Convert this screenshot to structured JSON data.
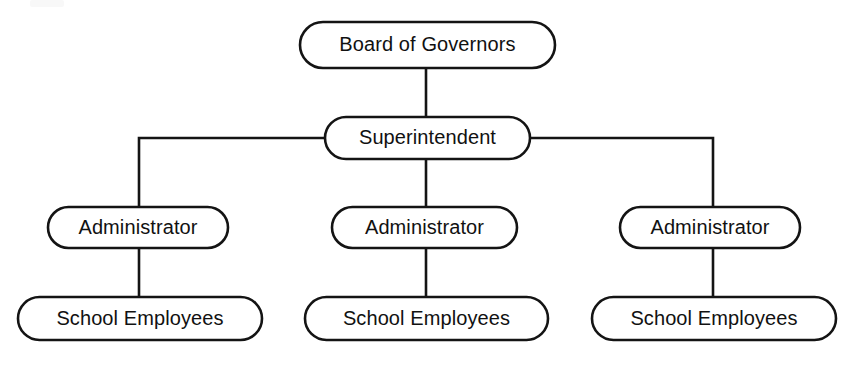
{
  "diagram": {
    "type": "organizational-chart",
    "background_color": "#ffffff",
    "stroke_color": "#141414",
    "text_color": "#111111",
    "node_shape": "rounded-pill",
    "levels": 4,
    "nodes": [
      {
        "id": "board",
        "label": "Board of Governors",
        "level": 1,
        "x": 300,
        "y": 22,
        "w": 255,
        "h": 46
      },
      {
        "id": "superintendent",
        "label": "Superintendent",
        "level": 2,
        "x": 325,
        "y": 117,
        "w": 205,
        "h": 42
      },
      {
        "id": "administrator-1",
        "label": "Administrator",
        "level": 3,
        "x": 48,
        "y": 207,
        "w": 180,
        "h": 41
      },
      {
        "id": "administrator-2",
        "label": "Administrator",
        "level": 3,
        "x": 332,
        "y": 207,
        "w": 185,
        "h": 41
      },
      {
        "id": "administrator-3",
        "label": "Administrator",
        "level": 3,
        "x": 620,
        "y": 207,
        "w": 180,
        "h": 41
      },
      {
        "id": "school-employees-1",
        "label": "School Employees",
        "level": 4,
        "x": 18,
        "y": 297,
        "w": 244,
        "h": 43
      },
      {
        "id": "school-employees-2",
        "label": "School Employees",
        "level": 4,
        "x": 305,
        "y": 297,
        "w": 243,
        "h": 43
      },
      {
        "id": "school-employees-3",
        "label": "School Employees",
        "level": 4,
        "x": 592,
        "y": 297,
        "w": 244,
        "h": 43
      }
    ],
    "connectors": [
      {
        "id": "board-to-superintendent",
        "from": "board",
        "to": "superintendent",
        "path": "M 426 68 L 426 117"
      },
      {
        "id": "superintendent-left-bus",
        "from": "superintendent",
        "to": "administrator-1",
        "path": "M 325 138 L 139 138 L 139 207"
      },
      {
        "id": "superintendent-center-drop",
        "from": "superintendent",
        "to": "administrator-2",
        "path": "M 426 159 L 426 207"
      },
      {
        "id": "superintendent-right-bus",
        "from": "superintendent",
        "to": "administrator-3",
        "path": "M 530 138 L 713 138 L 713 207"
      },
      {
        "id": "administrator-1-to-employees-1",
        "from": "administrator-1",
        "to": "school-employees-1",
        "path": "M 139 248 L 139 297"
      },
      {
        "id": "administrator-2-to-employees-2",
        "from": "administrator-2",
        "to": "school-employees-2",
        "path": "M 426 248 L 426 297"
      },
      {
        "id": "administrator-3-to-employees-3",
        "from": "administrator-3",
        "to": "school-employees-3",
        "path": "M 713 248 L 713 297"
      }
    ]
  }
}
